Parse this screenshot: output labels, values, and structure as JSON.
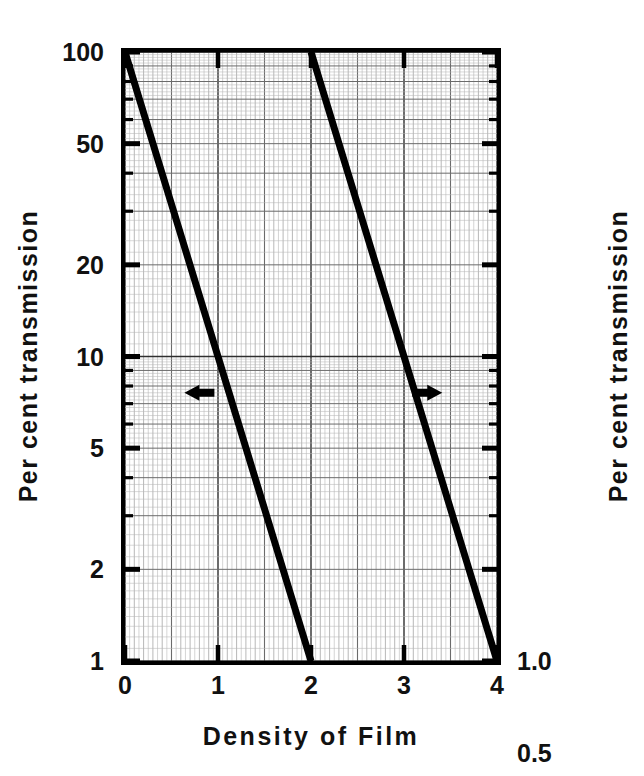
{
  "chart_data": {
    "type": "line",
    "title": "",
    "xlabel": "Density of Film",
    "ylabel": "Per cent transmission",
    "ylabel_right": "Per cent transmission",
    "xlim": [
      0,
      4
    ],
    "ylim": [
      1,
      100
    ],
    "yscale": "log",
    "xscale": "linear",
    "grid": true,
    "grid_style": "fine graph paper, minor and major rules",
    "legend": "none",
    "xticks": [
      "0",
      "1",
      "2",
      "3",
      "4"
    ],
    "xtick_values": [
      0,
      1,
      2,
      3,
      4
    ],
    "yticks_left": [
      "100",
      "50",
      "20",
      "10",
      "5",
      "2",
      "1"
    ],
    "ytick_values_left": [
      100,
      50,
      20,
      10,
      5,
      2,
      1
    ],
    "yticks_right": [
      "1.0",
      "0.5",
      "0.2",
      "0.10",
      "0.05",
      "0.02",
      "0.01"
    ],
    "ytick_values_right": [
      1.0,
      0.5,
      0.2,
      0.1,
      0.05,
      0.02,
      0.01
    ],
    "series": [
      {
        "name": "Left-hand scale (100% to 1%)",
        "axis": "left",
        "x": [
          0,
          0.5,
          1,
          1.5,
          2
        ],
        "values": [
          100,
          31.6,
          10,
          3.16,
          1
        ],
        "annotation": "left-arrow"
      },
      {
        "name": "Right-hand scale (1.0% to 0.01%)",
        "axis": "right",
        "x": [
          2,
          2.5,
          3,
          3.5,
          4
        ],
        "values": [
          1.0,
          0.316,
          0.1,
          0.0316,
          0.01
        ],
        "annotation": "right-arrow"
      }
    ],
    "annotations": [
      {
        "name": "left-arrow",
        "text": "◀",
        "points_to": "left axis",
        "x": 0.8,
        "y": 7.6
      },
      {
        "name": "right-arrow",
        "text": "▶",
        "points_to": "right axis",
        "x": 3.25,
        "y": 7.6
      }
    ]
  },
  "axes": {
    "x": {
      "title": "Density of Film",
      "ticks": [
        {
          "label": "0",
          "value": 0
        },
        {
          "label": "1",
          "value": 1
        },
        {
          "label": "2",
          "value": 2
        },
        {
          "label": "3",
          "value": 3
        },
        {
          "label": "4",
          "value": 4
        }
      ]
    },
    "y_left": {
      "title": "Per cent transmission",
      "ticks": [
        {
          "label": "100",
          "value": 100
        },
        {
          "label": "50",
          "value": 50
        },
        {
          "label": "20",
          "value": 20
        },
        {
          "label": "10",
          "value": 10
        },
        {
          "label": "5",
          "value": 5
        },
        {
          "label": "2",
          "value": 2
        },
        {
          "label": "1",
          "value": 1
        }
      ]
    },
    "y_right": {
      "title": "Per cent transmission",
      "ticks": [
        {
          "label": "1.0",
          "value": 1.0
        },
        {
          "label": "0.5",
          "value": 0.5
        },
        {
          "label": "0.2",
          "value": 0.2
        },
        {
          "label": "0.10",
          "value": 0.1
        },
        {
          "label": "0.05",
          "value": 0.05
        },
        {
          "label": "0.02",
          "value": 0.02
        },
        {
          "label": "0.01",
          "value": 0.01
        }
      ]
    }
  },
  "colors": {
    "ink": "#000000",
    "background": "#ffffff",
    "grid_major": "#6b6b6b",
    "grid_minor": "#b8b8b8"
  }
}
